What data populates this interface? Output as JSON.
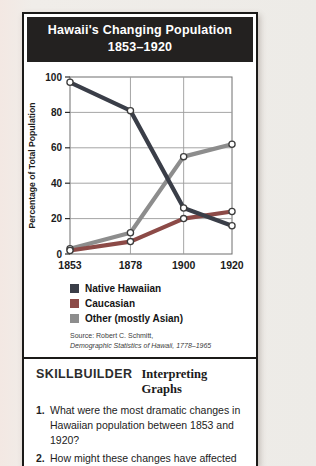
{
  "header": {
    "title_line1": "Hawaii's Changing Population",
    "title_line2": "1853–1920"
  },
  "chart_data": {
    "type": "line",
    "title": "Hawaii's Changing Population 1853–1920",
    "xlabel": "",
    "ylabel": "Percentage of Total Population",
    "x": [
      1853,
      1878,
      1900,
      1920
    ],
    "x_tick_labels": [
      "1853",
      "1878",
      "1900",
      "1920"
    ],
    "ylim": [
      0,
      100
    ],
    "y_ticks": [
      0,
      20,
      40,
      60,
      80,
      100
    ],
    "grid": true,
    "legend_position": "below-left",
    "marker": "open-circle",
    "series": [
      {
        "name": "Native Hawaiian",
        "color": "#3a3e48",
        "values": [
          97,
          81,
          26,
          16
        ]
      },
      {
        "name": "Caucasian",
        "color": "#8c4a47",
        "values": [
          2,
          7,
          20,
          24
        ]
      },
      {
        "name": "Other (mostly Asian)",
        "color": "#8d8d8d",
        "values": [
          3,
          12,
          55,
          62
        ]
      }
    ]
  },
  "source": {
    "line1": "Source: Robert C. Schmitt,",
    "line2": "Demographic Statistics of Hawaii, 1778–1965"
  },
  "skillbuilder": {
    "heading_main": "SKILLBUILDER",
    "heading_sub": "Interpreting Graphs",
    "questions": [
      {
        "number": "1.",
        "text": "What were the most dramatic changes in Hawaiian population between 1853 and 1920?"
      },
      {
        "number": "2.",
        "text": "How might these changes have affected"
      }
    ]
  },
  "colors": {
    "card_border": "#1b1a18",
    "header_bg": "#232120",
    "header_text": "#ffffff",
    "page_bg": "#f0ede9"
  }
}
